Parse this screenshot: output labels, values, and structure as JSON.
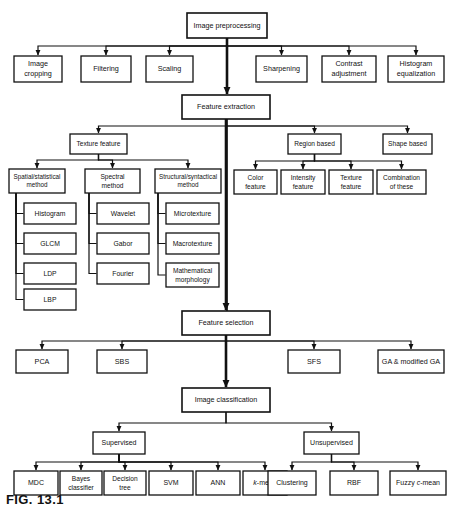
{
  "figure": {
    "caption": "FIG. 13.1",
    "canvas": {
      "width": 452,
      "height": 517
    },
    "colors": {
      "stroke": "#111111",
      "fill": "#ffffff",
      "text": "#111111"
    }
  },
  "chart_data": {
    "type": "diagram",
    "title": "FIG. 13.1",
    "nodes": [
      {
        "id": "image_preprocessing",
        "label": "Image preprocessing",
        "x": 187,
        "y": 13,
        "w": 80,
        "h": 25,
        "lw": 1.6,
        "fs": 7.2,
        "lines": [
          "Image preprocessing"
        ]
      },
      {
        "id": "image_cropping",
        "label": "Image cropping",
        "x": 14,
        "y": 56,
        "w": 48,
        "h": 26,
        "lw": 1.3,
        "fs": 7.2,
        "lines": [
          "Image",
          "cropping"
        ]
      },
      {
        "id": "filtering",
        "label": "Filtering",
        "x": 81,
        "y": 56,
        "w": 50,
        "h": 26,
        "lw": 1.3,
        "fs": 7.2,
        "lines": [
          "Filtering"
        ]
      },
      {
        "id": "scaling",
        "label": "Scaling",
        "x": 146,
        "y": 56,
        "w": 47,
        "h": 26,
        "lw": 1.3,
        "fs": 7.2,
        "lines": [
          "Scaling"
        ]
      },
      {
        "id": "sharpening",
        "label": "Sharpening",
        "x": 256,
        "y": 56,
        "w": 51,
        "h": 26,
        "lw": 1.3,
        "fs": 7.2,
        "lines": [
          "Sharpening"
        ]
      },
      {
        "id": "contrast_adjustment",
        "label": "Contrast adjustment",
        "x": 322,
        "y": 56,
        "w": 54,
        "h": 26,
        "lw": 1.3,
        "fs": 7.2,
        "lines": [
          "Contrast",
          "adjustment"
        ]
      },
      {
        "id": "histogram_equalization",
        "label": "Histogram equalization",
        "x": 388,
        "y": 56,
        "w": 56,
        "h": 26,
        "lw": 1.3,
        "fs": 7.2,
        "lines": [
          "Histogram",
          "equalization"
        ]
      },
      {
        "id": "feature_extraction",
        "label": "Feature extraction",
        "x": 182,
        "y": 95,
        "w": 88,
        "h": 24,
        "lw": 1.6,
        "fs": 7.2,
        "lines": [
          "Feature extraction"
        ]
      },
      {
        "id": "texture_feature_main",
        "label": "Texture feature",
        "x": 70,
        "y": 134,
        "w": 57,
        "h": 20,
        "lw": 1.3,
        "fs": 6.6,
        "lines": [
          "Texture feature"
        ]
      },
      {
        "id": "region_based",
        "label": "Region based",
        "x": 288,
        "y": 134,
        "w": 53,
        "h": 20,
        "lw": 1.3,
        "fs": 6.6,
        "lines": [
          "Region based"
        ]
      },
      {
        "id": "shape_based",
        "label": "Shape based",
        "x": 383,
        "y": 134,
        "w": 49,
        "h": 20,
        "lw": 1.3,
        "fs": 6.6,
        "lines": [
          "Shape based"
        ]
      },
      {
        "id": "spatial_statistical_method",
        "label": "Spatial/statistical method",
        "x": 9,
        "y": 169,
        "w": 56,
        "h": 24,
        "lw": 1.3,
        "fs": 6.3,
        "lines": [
          "Spatial/statistical",
          "method"
        ]
      },
      {
        "id": "spectral_method",
        "label": "Spectral method",
        "x": 85,
        "y": 169,
        "w": 55,
        "h": 24,
        "lw": 1.3,
        "fs": 6.6,
        "lines": [
          "Spectral",
          "method"
        ]
      },
      {
        "id": "structural_syntactical_method",
        "label": "Structural/syntactical method",
        "x": 155,
        "y": 169,
        "w": 66,
        "h": 24,
        "lw": 1.3,
        "fs": 6.3,
        "lines": [
          "Structural/syntactical",
          "method"
        ]
      },
      {
        "id": "color_feature",
        "label": "Color feature",
        "x": 234,
        "y": 170,
        "w": 43,
        "h": 24,
        "lw": 1.3,
        "fs": 6.6,
        "lines": [
          "Color",
          "feature"
        ]
      },
      {
        "id": "intensity_feature",
        "label": "Intensity feature",
        "x": 281,
        "y": 170,
        "w": 44,
        "h": 24,
        "lw": 1.3,
        "fs": 6.6,
        "lines": [
          "Intensity",
          "feature"
        ]
      },
      {
        "id": "texture_feature_region",
        "label": "Texture feature",
        "x": 329,
        "y": 170,
        "w": 44,
        "h": 24,
        "lw": 1.3,
        "fs": 6.6,
        "lines": [
          "Texture",
          "feature"
        ]
      },
      {
        "id": "combination_of_these",
        "label": "Combination of these",
        "x": 377,
        "y": 170,
        "w": 49,
        "h": 24,
        "lw": 1.3,
        "fs": 6.6,
        "lines": [
          "Combination",
          "of these"
        ]
      },
      {
        "id": "histogram",
        "label": "Histogram",
        "x": 24,
        "y": 203,
        "w": 52,
        "h": 21,
        "lw": 1.3,
        "fs": 6.8,
        "lines": [
          "Histogram"
        ]
      },
      {
        "id": "glcm",
        "label": "GLCM",
        "x": 24,
        "y": 233,
        "w": 52,
        "h": 21,
        "lw": 1.3,
        "fs": 6.8,
        "lines": [
          "GLCM"
        ]
      },
      {
        "id": "ldp",
        "label": "LDP",
        "x": 24,
        "y": 263,
        "w": 52,
        "h": 21,
        "lw": 1.3,
        "fs": 6.8,
        "lines": [
          "LDP"
        ]
      },
      {
        "id": "lbp",
        "label": "LBP",
        "x": 24,
        "y": 289,
        "w": 52,
        "h": 21,
        "lw": 1.3,
        "fs": 6.8,
        "lines": [
          "LBP"
        ]
      },
      {
        "id": "wavelet",
        "label": "Wavelet",
        "x": 97,
        "y": 203,
        "w": 52,
        "h": 21,
        "lw": 1.3,
        "fs": 6.8,
        "lines": [
          "Wavelet"
        ]
      },
      {
        "id": "gabor",
        "label": "Gabor",
        "x": 97,
        "y": 233,
        "w": 52,
        "h": 21,
        "lw": 1.3,
        "fs": 6.8,
        "lines": [
          "Gabor"
        ]
      },
      {
        "id": "fourier",
        "label": "Fourier",
        "x": 97,
        "y": 263,
        "w": 52,
        "h": 21,
        "lw": 1.3,
        "fs": 6.8,
        "lines": [
          "Fourier"
        ]
      },
      {
        "id": "microtexture",
        "label": "Microtexture",
        "x": 166,
        "y": 203,
        "w": 53,
        "h": 21,
        "lw": 1.3,
        "fs": 6.8,
        "lines": [
          "Microtexture"
        ]
      },
      {
        "id": "macrotexture",
        "label": "Macrotexture",
        "x": 166,
        "y": 233,
        "w": 53,
        "h": 21,
        "lw": 1.3,
        "fs": 6.8,
        "lines": [
          "Macrotexture"
        ]
      },
      {
        "id": "mathematical_morphology",
        "label": "Mathematical morphology",
        "x": 166,
        "y": 263,
        "w": 53,
        "h": 24,
        "lw": 1.3,
        "fs": 6.6,
        "lines": [
          "Mathematical",
          "morphology"
        ]
      },
      {
        "id": "feature_selection",
        "label": "Feature selection",
        "x": 182,
        "y": 311,
        "w": 88,
        "h": 24,
        "lw": 1.6,
        "fs": 7.2,
        "lines": [
          "Feature selection"
        ]
      },
      {
        "id": "pca",
        "label": "PCA",
        "x": 16,
        "y": 350,
        "w": 52,
        "h": 23,
        "lw": 1.3,
        "fs": 7.2,
        "lines": [
          "PCA"
        ]
      },
      {
        "id": "sbs",
        "label": "SBS",
        "x": 97,
        "y": 350,
        "w": 50,
        "h": 23,
        "lw": 1.3,
        "fs": 7.2,
        "lines": [
          "SBS"
        ]
      },
      {
        "id": "sfs",
        "label": "SFS",
        "x": 288,
        "y": 350,
        "w": 52,
        "h": 23,
        "lw": 1.3,
        "fs": 7.2,
        "lines": [
          "SFS"
        ]
      },
      {
        "id": "ga_modified_ga",
        "label": "GA & modified GA",
        "x": 378,
        "y": 350,
        "w": 66,
        "h": 23,
        "lw": 1.3,
        "fs": 7.2,
        "lines": [
          "GA & modified GA"
        ]
      },
      {
        "id": "image_classification",
        "label": "Image classification",
        "x": 182,
        "y": 388,
        "w": 88,
        "h": 24,
        "lw": 1.6,
        "fs": 7.2,
        "lines": [
          "Image classification"
        ]
      },
      {
        "id": "supervised",
        "label": "Supervised",
        "x": 93,
        "y": 432,
        "w": 52,
        "h": 22,
        "lw": 1.3,
        "fs": 7,
        "lines": [
          "Supervised"
        ]
      },
      {
        "id": "unsupervised",
        "label": "Unsupervised",
        "x": 304,
        "y": 432,
        "w": 55,
        "h": 22,
        "lw": 1.3,
        "fs": 7,
        "lines": [
          "Unsupervised"
        ]
      },
      {
        "id": "mdc",
        "label": "MDC",
        "x": 14,
        "y": 471,
        "w": 44,
        "h": 24,
        "lw": 1.3,
        "fs": 7,
        "lines": [
          "MDC"
        ]
      },
      {
        "id": "bayes_classifier",
        "label": "Bayes classifier",
        "x": 60,
        "y": 471,
        "w": 42,
        "h": 24,
        "lw": 1.3,
        "fs": 6.6,
        "lines": [
          "Bayes",
          "classifier"
        ]
      },
      {
        "id": "decision_tree",
        "label": "Decision tree",
        "x": 104,
        "y": 471,
        "w": 42,
        "h": 24,
        "lw": 1.3,
        "fs": 6.6,
        "lines": [
          "Decision",
          "tree"
        ]
      },
      {
        "id": "svm",
        "label": "SVM",
        "x": 149,
        "y": 471,
        "w": 44,
        "h": 24,
        "lw": 1.3,
        "fs": 7,
        "lines": [
          "SVM"
        ]
      },
      {
        "id": "ann",
        "label": "ANN",
        "x": 196,
        "y": 471,
        "w": 44,
        "h": 24,
        "lw": 1.3,
        "fs": 7,
        "lines": [
          "ANN"
        ]
      },
      {
        "id": "k_mean",
        "label": "k-mean",
        "x": 243,
        "y": 471,
        "w": 44,
        "h": 24,
        "lw": 1.3,
        "fs": 7,
        "italicFirst": true,
        "lines": [
          "k-mean"
        ]
      },
      {
        "id": "clustering",
        "label": "Clustering",
        "x": 268,
        "y": 471,
        "w": 48,
        "h": 24,
        "lw": 1.3,
        "fs": 7,
        "lines": [
          "Clustering"
        ]
      },
      {
        "id": "rbf",
        "label": "RBF",
        "x": 330,
        "y": 471,
        "w": 48,
        "h": 24,
        "lw": 1.3,
        "fs": 7,
        "lines": [
          "RBF"
        ]
      },
      {
        "id": "fuzzy_c_mean",
        "label": "Fuzzy c-mean",
        "x": 390,
        "y": 471,
        "w": 56,
        "h": 24,
        "lw": 1.3,
        "fs": 7,
        "italicFirst": true,
        "lines": [
          "Fuzzy c-mean"
        ]
      }
    ],
    "edges": [
      {
        "from": "image_preprocessing",
        "to": "image_cropping",
        "style": "bus",
        "busY": 46,
        "arrow": true
      },
      {
        "from": "image_preprocessing",
        "to": "filtering",
        "style": "bus",
        "busY": 46,
        "arrow": true
      },
      {
        "from": "image_preprocessing",
        "to": "scaling",
        "style": "bus",
        "busY": 46,
        "arrow": true
      },
      {
        "from": "image_preprocessing",
        "to": "sharpening",
        "style": "bus",
        "busY": 46,
        "arrow": true
      },
      {
        "from": "image_preprocessing",
        "to": "contrast_adjustment",
        "style": "bus",
        "busY": 46,
        "arrow": true
      },
      {
        "from": "image_preprocessing",
        "to": "histogram_equalization",
        "style": "bus",
        "busY": 46,
        "arrow": true
      },
      {
        "from": "image_preprocessing",
        "to": "feature_extraction",
        "style": "straight",
        "arrow": true,
        "thick": true
      },
      {
        "from": "feature_extraction",
        "to": "texture_feature_main",
        "style": "bus",
        "busY": 126,
        "arrow": true
      },
      {
        "from": "feature_extraction",
        "to": "region_based",
        "style": "bus",
        "busY": 126,
        "arrow": true
      },
      {
        "from": "feature_extraction",
        "to": "shape_based",
        "style": "bus",
        "busY": 126,
        "arrow": true
      },
      {
        "from": "feature_extraction",
        "to": "feature_selection",
        "style": "straight",
        "arrow": true,
        "thick": true
      },
      {
        "from": "texture_feature_main",
        "to": "spatial_statistical_method",
        "style": "bus",
        "busY": 160,
        "arrow": true
      },
      {
        "from": "texture_feature_main",
        "to": "spectral_method",
        "style": "bus",
        "busY": 160,
        "arrow": true
      },
      {
        "from": "texture_feature_main",
        "to": "structural_syntactical_method",
        "style": "bus",
        "busY": 160,
        "arrow": true
      },
      {
        "from": "region_based",
        "to": "color_feature",
        "style": "bus",
        "busY": 161,
        "arrow": true
      },
      {
        "from": "region_based",
        "to": "intensity_feature",
        "style": "bus",
        "busY": 161,
        "arrow": true
      },
      {
        "from": "region_based",
        "to": "texture_feature_region",
        "style": "bus",
        "busY": 161,
        "arrow": true
      },
      {
        "from": "region_based",
        "to": "combination_of_these",
        "style": "bus",
        "busY": 161,
        "arrow": true
      },
      {
        "from": "spatial_statistical_method",
        "to": "histogram",
        "style": "spine",
        "spineX": 16,
        "arrow": false
      },
      {
        "from": "spatial_statistical_method",
        "to": "glcm",
        "style": "spine",
        "spineX": 16,
        "arrow": false
      },
      {
        "from": "spatial_statistical_method",
        "to": "ldp",
        "style": "spine",
        "spineX": 16,
        "arrow": false
      },
      {
        "from": "spatial_statistical_method",
        "to": "lbp",
        "style": "spine",
        "spineX": 16,
        "arrow": false
      },
      {
        "from": "spectral_method",
        "to": "wavelet",
        "style": "spine",
        "spineX": 89,
        "arrow": false
      },
      {
        "from": "spectral_method",
        "to": "gabor",
        "style": "spine",
        "spineX": 89,
        "arrow": false
      },
      {
        "from": "spectral_method",
        "to": "fourier",
        "style": "spine",
        "spineX": 89,
        "arrow": false
      },
      {
        "from": "structural_syntactical_method",
        "to": "microtexture",
        "style": "spine",
        "spineX": 158,
        "arrow": false
      },
      {
        "from": "structural_syntactical_method",
        "to": "macrotexture",
        "style": "spine",
        "spineX": 158,
        "arrow": false
      },
      {
        "from": "structural_syntactical_method",
        "to": "mathematical_morphology",
        "style": "spine",
        "spineX": 158,
        "arrow": false
      },
      {
        "from": "feature_selection",
        "to": "pca",
        "style": "bus",
        "busY": 341,
        "arrow": true
      },
      {
        "from": "feature_selection",
        "to": "sbs",
        "style": "bus",
        "busY": 341,
        "arrow": true
      },
      {
        "from": "feature_selection",
        "to": "sfs",
        "style": "bus",
        "busY": 341,
        "arrow": true
      },
      {
        "from": "feature_selection",
        "to": "ga_modified_ga",
        "style": "bus",
        "busY": 341,
        "arrow": true
      },
      {
        "from": "feature_selection",
        "to": "image_classification",
        "style": "straight",
        "arrow": true,
        "thick": true
      },
      {
        "from": "image_classification",
        "to": "supervised",
        "style": "bus",
        "busY": 423,
        "arrow": true
      },
      {
        "from": "image_classification",
        "to": "unsupervised",
        "style": "bus",
        "busY": 423,
        "arrow": true
      },
      {
        "from": "supervised",
        "to": "mdc",
        "style": "bus",
        "busY": 462,
        "arrow": true
      },
      {
        "from": "supervised",
        "to": "bayes_classifier",
        "style": "bus",
        "busY": 462,
        "arrow": true
      },
      {
        "from": "supervised",
        "to": "decision_tree",
        "style": "bus",
        "busY": 462,
        "arrow": true
      },
      {
        "from": "supervised",
        "to": "svm",
        "style": "bus",
        "busY": 462,
        "arrow": true
      },
      {
        "from": "supervised",
        "to": "ann",
        "style": "bus",
        "busY": 462,
        "arrow": true
      },
      {
        "from": "supervised",
        "to": "k_mean",
        "style": "bus",
        "busY": 462,
        "arrow": true
      },
      {
        "from": "unsupervised",
        "to": "clustering",
        "style": "bus",
        "busY": 462,
        "arrow": true
      },
      {
        "from": "unsupervised",
        "to": "rbf",
        "style": "bus",
        "busY": 462,
        "arrow": true
      },
      {
        "from": "unsupervised",
        "to": "fuzzy_c_mean",
        "style": "bus",
        "busY": 462,
        "arrow": true
      }
    ],
    "separators": [
      {
        "id": "vertical-divider",
        "x1": 227,
        "y1": 119,
        "x2": 227,
        "y2": 311
      }
    ]
  }
}
